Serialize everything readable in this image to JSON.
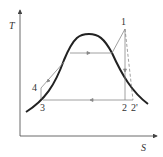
{
  "diagram": {
    "type": "T-s diagram (Rankine cycle)",
    "axes": {
      "y_label": "T",
      "x_label": "S"
    },
    "points": [
      {
        "id": "1",
        "label": "1"
      },
      {
        "id": "2",
        "label": "2"
      },
      {
        "id": "2p",
        "label": "2'"
      },
      {
        "id": "3",
        "label": "3"
      },
      {
        "id": "4",
        "label": "4"
      }
    ],
    "colors": {
      "curve": "#222222",
      "lines": "#888888",
      "axes": "#444444"
    }
  }
}
